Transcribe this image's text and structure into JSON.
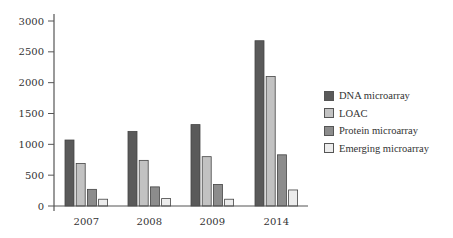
{
  "chart_data": {
    "type": "bar",
    "title": "",
    "xlabel": "",
    "ylabel": "",
    "categories": [
      "2007",
      "2008",
      "2009",
      "2014"
    ],
    "series": [
      {
        "name": "DNA microarray",
        "color": "#5a5a5a",
        "values": [
          1070,
          1210,
          1320,
          2680
        ]
      },
      {
        "name": "LOAC",
        "color": "#c2c2c2",
        "values": [
          690,
          740,
          800,
          2100
        ]
      },
      {
        "name": "Protein microarray",
        "color": "#8c8c8c",
        "values": [
          270,
          310,
          350,
          830
        ]
      },
      {
        "name": "Emerging microarray",
        "color": "#ececec",
        "values": [
          110,
          120,
          110,
          260
        ]
      }
    ],
    "ylim": [
      0,
      3000
    ],
    "yticks": [
      0,
      500,
      1000,
      1500,
      2000,
      2500,
      3000
    ],
    "grid": false,
    "legend_position": "right"
  }
}
